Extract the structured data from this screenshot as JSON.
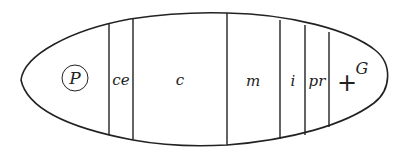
{
  "diagram": {
    "type": "segmented-ellipse",
    "stroke_color": "#222222",
    "background": "#ffffff",
    "regions": [
      {
        "id": "P",
        "label": "P",
        "circled": true
      },
      {
        "id": "ce",
        "label": "ce"
      },
      {
        "id": "c",
        "label": "c"
      },
      {
        "id": "m",
        "label": "m"
      },
      {
        "id": "i",
        "label": "i"
      },
      {
        "id": "pr",
        "label": "pr"
      },
      {
        "id": "G",
        "label": "+",
        "superscript": "G"
      }
    ]
  }
}
